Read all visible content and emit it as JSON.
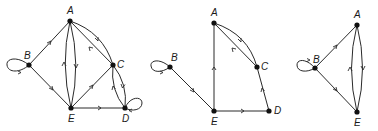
{
  "diagram": {
    "type": "directed-graphs",
    "stroke_color": "#2a2a2a",
    "node_color": "#111111",
    "graphs": [
      {
        "id": "graph-1",
        "nodes": [
          {
            "id": "A",
            "label": "A",
            "x": 70,
            "y": 21
          },
          {
            "id": "B",
            "label": "B",
            "x": 29,
            "y": 65
          },
          {
            "id": "C",
            "label": "C",
            "x": 113,
            "y": 65
          },
          {
            "id": "D",
            "label": "D",
            "x": 125,
            "y": 108
          },
          {
            "id": "E",
            "label": "E",
            "x": 71,
            "y": 108
          }
        ],
        "edges": [
          {
            "from": "B",
            "to": "B",
            "kind": "loop"
          },
          {
            "from": "B",
            "to": "A"
          },
          {
            "from": "B",
            "to": "E"
          },
          {
            "from": "E",
            "to": "A",
            "kind": "curve-left"
          },
          {
            "from": "A",
            "to": "E",
            "kind": "curve-right"
          },
          {
            "from": "A",
            "to": "C",
            "kind": "curve-outer"
          },
          {
            "from": "C",
            "to": "A"
          },
          {
            "from": "E",
            "to": "C"
          },
          {
            "from": "E",
            "to": "D"
          },
          {
            "from": "C",
            "to": "D",
            "kind": "curve-right"
          },
          {
            "from": "D",
            "to": "C",
            "kind": "curve-left"
          },
          {
            "from": "D",
            "to": "D",
            "kind": "loop"
          }
        ]
      },
      {
        "id": "graph-2",
        "nodes": [
          {
            "id": "A",
            "label": "A",
            "x": 214,
            "y": 23
          },
          {
            "id": "B",
            "label": "B",
            "x": 170,
            "y": 67
          },
          {
            "id": "C",
            "label": "C",
            "x": 257,
            "y": 67
          },
          {
            "id": "D",
            "label": "D",
            "x": 269,
            "y": 111
          },
          {
            "id": "E",
            "label": "E",
            "x": 214,
            "y": 111
          }
        ],
        "edges": [
          {
            "from": "B",
            "to": "B",
            "kind": "loop"
          },
          {
            "from": "B",
            "to": "E"
          },
          {
            "from": "E",
            "to": "A"
          },
          {
            "from": "A",
            "to": "C",
            "kind": "curve-outer"
          },
          {
            "from": "C",
            "to": "A"
          },
          {
            "from": "E",
            "to": "D"
          },
          {
            "from": "D",
            "to": "C"
          }
        ]
      },
      {
        "id": "graph-3",
        "nodes": [
          {
            "id": "A",
            "label": "A",
            "x": 357,
            "y": 25
          },
          {
            "id": "B",
            "label": "B",
            "x": 315,
            "y": 68
          },
          {
            "id": "E",
            "label": "E",
            "x": 357,
            "y": 112
          }
        ],
        "edges": [
          {
            "from": "B",
            "to": "B",
            "kind": "loop"
          },
          {
            "from": "B",
            "to": "A"
          },
          {
            "from": "B",
            "to": "E"
          },
          {
            "from": "E",
            "to": "A",
            "kind": "curve-left"
          },
          {
            "from": "A",
            "to": "E",
            "kind": "curve-right"
          }
        ]
      }
    ]
  }
}
